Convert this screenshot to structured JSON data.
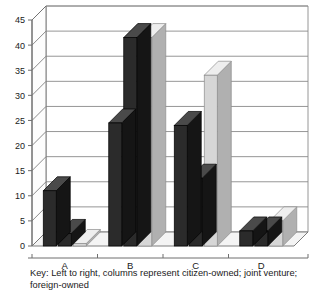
{
  "chart_data": {
    "type": "bar",
    "title": "",
    "subtitle": "",
    "xlabel": "",
    "ylabel": "",
    "categories": [
      "A",
      "B",
      "C",
      "D"
    ],
    "ylim": [
      0,
      45
    ],
    "ytick_step": 5,
    "yticks": [
      "0",
      "5",
      "10",
      "15",
      "20",
      "25",
      "30",
      "35",
      "40",
      "45"
    ],
    "grid": "horizontal",
    "legend_position": "below-axis",
    "style": "3d-columns",
    "series": [
      {
        "name": "citizen-owned",
        "color": "#2b2b2b",
        "values": [
          11,
          24.5,
          24,
          3
        ]
      },
      {
        "name": "joint venture",
        "color": "#2b2b2b",
        "values": [
          2.5,
          41.5,
          13.5,
          3
        ]
      },
      {
        "name": "foreign-owned",
        "color": "#d6d6d6",
        "values": [
          0.5,
          41.5,
          34,
          5
        ]
      }
    ],
    "annotations": {
      "key_line1": "Key: Left to right, columns represent citizen-owned; joint venture;",
      "key_line2": "foreign-owned"
    }
  },
  "colors": {
    "dark_bar": "#2b2b2b",
    "dark_bar_top": "#4a4a4a",
    "dark_bar_side": "#151515",
    "light_bar": "#d6d6d6",
    "light_bar_top": "#eeeeee",
    "light_bar_side": "#b0b0b0",
    "grid": "#8a8a8a",
    "axis": "#6f6f6f",
    "floor": "#f4f4f4",
    "wall": "#ffffff",
    "text": "#1a1a1a"
  }
}
